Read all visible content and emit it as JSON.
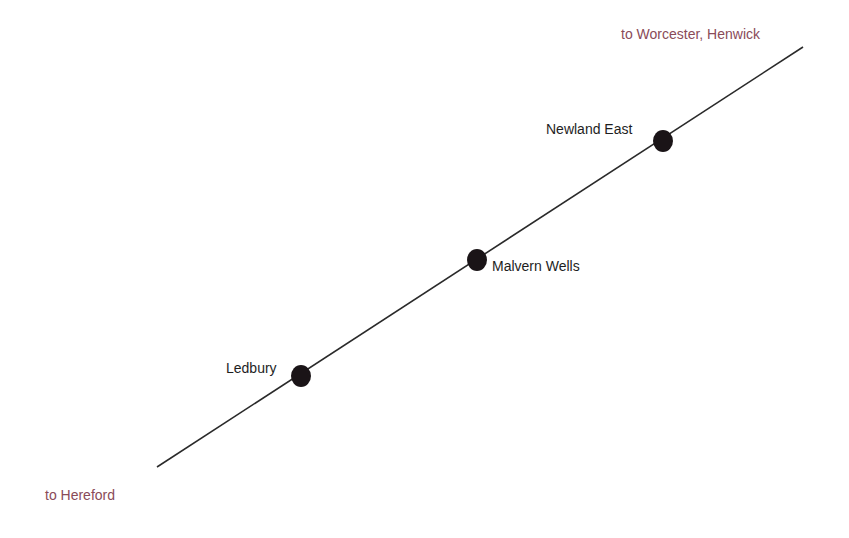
{
  "diagram": {
    "type": "railway-line-diagram",
    "line": {
      "x1": 157,
      "y1": 467,
      "x2": 803,
      "y2": 47,
      "color": "#2a2a2a"
    },
    "termini": [
      {
        "label": "to Worcester, Henwick",
        "x": 621,
        "y": 26,
        "color": "#8a4b58"
      },
      {
        "label": "to Hereford",
        "x": 45,
        "y": 487,
        "color": "#8a4b58"
      }
    ],
    "stations": [
      {
        "name": "Newland East",
        "dot_x": 663,
        "dot_y": 141,
        "label_x": 546,
        "label_y": 121
      },
      {
        "name": "Malvern Wells",
        "dot_x": 477,
        "dot_y": 260,
        "label_x": 492,
        "label_y": 258
      },
      {
        "name": "Ledbury",
        "dot_x": 301,
        "dot_y": 376,
        "label_x": 226,
        "label_y": 360
      }
    ],
    "dot_color": "#1a1417"
  }
}
